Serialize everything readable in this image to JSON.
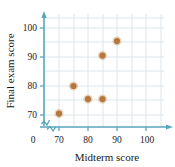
{
  "chart_data": {
    "type": "scatter",
    "title": "",
    "xlabel": "Midterm score",
    "ylabel": "Final exam score",
    "xlim": [
      66,
      104
    ],
    "ylim": [
      66,
      104
    ],
    "xticks": [
      70,
      80,
      90,
      100
    ],
    "yticks": [
      70,
      80,
      90,
      100
    ],
    "xtick_labels": [
      "70",
      "80",
      "90",
      "100"
    ],
    "ytick_labels": [
      "70",
      "80",
      "90",
      "100"
    ],
    "origin_label": "0",
    "axis_break": true,
    "grid": true,
    "legend": "none",
    "marker_color": "#b5783c",
    "axis_color": "#58a6bb",
    "grid_color": "#d8e3e8",
    "points": [
      {
        "x": 70,
        "y": 70.5
      },
      {
        "x": 75,
        "y": 80.0
      },
      {
        "x": 80,
        "y": 75.5
      },
      {
        "x": 85,
        "y": 75.5
      },
      {
        "x": 85,
        "y": 90.5
      },
      {
        "x": 90,
        "y": 95.5
      }
    ]
  }
}
